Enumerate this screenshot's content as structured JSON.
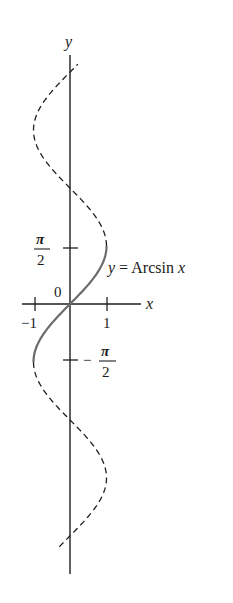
{
  "figure": {
    "labels": {
      "y_axis": "y",
      "x_axis": "x",
      "origin": "0",
      "x_tick_neg1": "−1",
      "x_tick_pos1": "1",
      "pi": "π",
      "two": "2",
      "minus": "−",
      "curve_label_y": "y",
      "curve_label_eq": " = Arcsin ",
      "curve_label_x": "x"
    },
    "colors": {
      "axis": "#1f1f1f",
      "dashed_curve": "#1f1f1f",
      "arcsin_curve": "#6b6b6b"
    }
  },
  "chart_data": {
    "type": "line",
    "title": "",
    "xlabel": "x",
    "ylabel": "y",
    "xlim": [
      -1.3,
      2.0
    ],
    "ylim": [
      -7.4,
      6.8
    ],
    "x_ticks": [
      {
        "value": -1,
        "label": "−1"
      },
      {
        "value": 1,
        "label": "1"
      }
    ],
    "y_ticks": [
      {
        "value": 1.5708,
        "label": "π/2"
      },
      {
        "value": -1.5708,
        "label": "−π/2"
      }
    ],
    "origin_label": "0",
    "series": [
      {
        "name": "y = Arcsin x",
        "style": "solid",
        "relation": "x = sin(y)",
        "y_range": [
          -1.5708,
          1.5708
        ]
      },
      {
        "name": "x = sin y (upper, dashed)",
        "style": "dashed",
        "relation": "x = sin(y)",
        "y_range": [
          1.5708,
          6.5
        ]
      },
      {
        "name": "x = sin y (lower, dashed)",
        "style": "dashed",
        "relation": "x = sin(y)",
        "y_range": [
          -6.61,
          -1.5708
        ]
      }
    ],
    "annotations": [
      {
        "text": "y = Arcsin x",
        "x": 1.05,
        "y": 0.98
      }
    ],
    "grid": false,
    "legend": "none"
  }
}
